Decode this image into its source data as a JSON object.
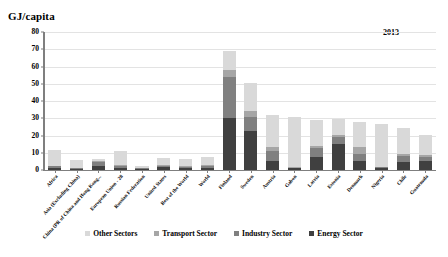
{
  "chart_data": {
    "type": "bar",
    "stacked": true,
    "title": "",
    "annotation": "2013",
    "ylabel": "GJ/capita",
    "xlabel": "",
    "ylim": [
      0,
      80
    ],
    "yticks": [
      0,
      10,
      20,
      30,
      40,
      50,
      60,
      70,
      80
    ],
    "grid": true,
    "legend_position": "bottom",
    "categories": [
      "Africa",
      "Asia (Excluding China)",
      "China (PR of China and Hong Kong...",
      "European Union - 28",
      "Russian Federation",
      "United States",
      "Rest of the World",
      "World",
      "Finland",
      "Sweden",
      "Austria",
      "Gabon",
      "Latvia",
      "Estonia",
      "Denmark",
      "Nigeria",
      "Chile",
      "Guatemala"
    ],
    "series": [
      {
        "name": "Energy Sector",
        "color": "#404040",
        "values": [
          1.2,
          0.6,
          2.6,
          1.4,
          0.7,
          1.6,
          1.1,
          1.4,
          30.0,
          22.5,
          5.0,
          1.0,
          7.5,
          15.0,
          5.0,
          1.0,
          4.5,
          5.5
        ]
      },
      {
        "name": "Industry Sector",
        "color": "#808080",
        "values": [
          0.9,
          0.5,
          2.0,
          1.2,
          0.4,
          1.0,
          0.8,
          1.0,
          24.0,
          8.0,
          6.0,
          0.4,
          5.0,
          4.0,
          4.5,
          0.5,
          3.5,
          2.0
        ]
      },
      {
        "name": "Transport Sector",
        "color": "#a6a6a6",
        "values": [
          0.5,
          0.3,
          0.6,
          0.5,
          0.2,
          0.6,
          0.4,
          0.5,
          4.0,
          3.5,
          2.5,
          0.3,
          1.5,
          1.5,
          4.0,
          0.4,
          1.5,
          1.0
        ]
      },
      {
        "name": "Other Sectors",
        "color": "#d9d9d9",
        "values": [
          9.0,
          4.5,
          1.0,
          8.0,
          1.0,
          3.5,
          4.0,
          4.5,
          11.0,
          16.5,
          18.5,
          29.0,
          15.0,
          9.0,
          14.5,
          25.0,
          15.0,
          12.0
        ]
      }
    ]
  }
}
